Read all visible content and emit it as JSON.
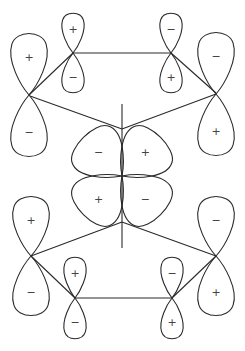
{
  "diagram": {
    "title": "",
    "stroke_color": "#2a2a2a",
    "sign_color": "#444444",
    "axis": {
      "x": 122,
      "y1": 104,
      "y2": 248
    },
    "bonds": [
      {
        "id": "top-left-outer-to-inner",
        "points": [
          [
            29,
            95
          ],
          [
            73,
            53
          ]
        ]
      },
      {
        "id": "top-inner-bridge",
        "points": [
          [
            73,
            53
          ],
          [
            171,
            53
          ]
        ]
      },
      {
        "id": "top-right-inner-to-outer",
        "points": [
          [
            171,
            53
          ],
          [
            216,
            93
          ]
        ]
      },
      {
        "id": "top-left-to-center",
        "points": [
          [
            30,
            96
          ],
          [
            122,
            129
          ]
        ]
      },
      {
        "id": "top-right-to-center",
        "points": [
          [
            216,
            94
          ],
          [
            122,
            129
          ]
        ]
      },
      {
        "id": "bottom-left-to-center",
        "points": [
          [
            31,
            256
          ],
          [
            122,
            222
          ]
        ]
      },
      {
        "id": "bottom-right-to-center",
        "points": [
          [
            216,
            256
          ],
          [
            122,
            222
          ]
        ]
      },
      {
        "id": "bottom-left-outer-to-inner",
        "points": [
          [
            31,
            256
          ],
          [
            75,
            298
          ]
        ]
      },
      {
        "id": "bottom-inner-bridge",
        "points": [
          [
            75,
            298
          ],
          [
            172,
            298
          ]
        ]
      },
      {
        "id": "bottom-right-inner-to-outer",
        "points": [
          [
            172,
            298
          ],
          [
            216,
            256
          ]
        ]
      }
    ],
    "p_orbitals": [
      {
        "id": "top-left-outer",
        "cx": 29,
        "cy": 95,
        "len": 62,
        "half_width": 18,
        "upper_sign": "+",
        "lower_sign": "−"
      },
      {
        "id": "top-left-inner",
        "cx": 73,
        "cy": 53,
        "len": 40,
        "half_width": 11,
        "upper_sign": "+",
        "lower_sign": "−"
      },
      {
        "id": "top-right-inner",
        "cx": 171,
        "cy": 53,
        "len": 40,
        "half_width": 11,
        "upper_sign": "−",
        "lower_sign": "+"
      },
      {
        "id": "top-right-outer",
        "cx": 216,
        "cy": 94,
        "len": 62,
        "half_width": 18,
        "upper_sign": "−",
        "lower_sign": "+"
      },
      {
        "id": "bottom-left-outer",
        "cx": 31,
        "cy": 256,
        "len": 60,
        "half_width": 18,
        "upper_sign": "+",
        "lower_sign": "−"
      },
      {
        "id": "bottom-left-inner",
        "cx": 75,
        "cy": 298,
        "len": 41,
        "half_width": 11,
        "upper_sign": "+",
        "lower_sign": "−"
      },
      {
        "id": "bottom-right-inner",
        "cx": 172,
        "cy": 298,
        "len": 41,
        "half_width": 11,
        "upper_sign": "−",
        "lower_sign": "+"
      },
      {
        "id": "bottom-right-outer",
        "cx": 216,
        "cy": 256,
        "len": 60,
        "half_width": 18,
        "upper_sign": "−",
        "lower_sign": "+"
      }
    ],
    "d_orbital": {
      "cx": 122,
      "cy": 176,
      "len": 55,
      "half_width": 27,
      "lobes": [
        {
          "id": "upper-left",
          "angle": -135,
          "sign": "−"
        },
        {
          "id": "upper-right",
          "angle": -45,
          "sign": "+"
        },
        {
          "id": "lower-left",
          "angle": 135,
          "sign": "+"
        },
        {
          "id": "lower-right",
          "angle": 45,
          "sign": "−"
        }
      ]
    }
  }
}
